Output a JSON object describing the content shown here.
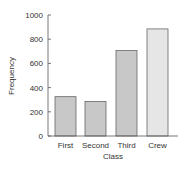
{
  "chart_data": {
    "type": "bar",
    "title": "",
    "xlabel": "Class",
    "ylabel": "Frequency",
    "categories": [
      "First",
      "Second",
      "Third",
      "Crew"
    ],
    "values": [
      325,
      285,
      706,
      885
    ],
    "ylim": [
      0,
      1000
    ],
    "yticks": [
      0,
      200,
      400,
      600,
      800,
      1000
    ],
    "grid": false,
    "legend": null,
    "colors": {
      "bar": "#c8c8c8",
      "bar_crew": "#e6e6e6",
      "bar_stroke": "#666666",
      "axis": "#555555"
    }
  }
}
